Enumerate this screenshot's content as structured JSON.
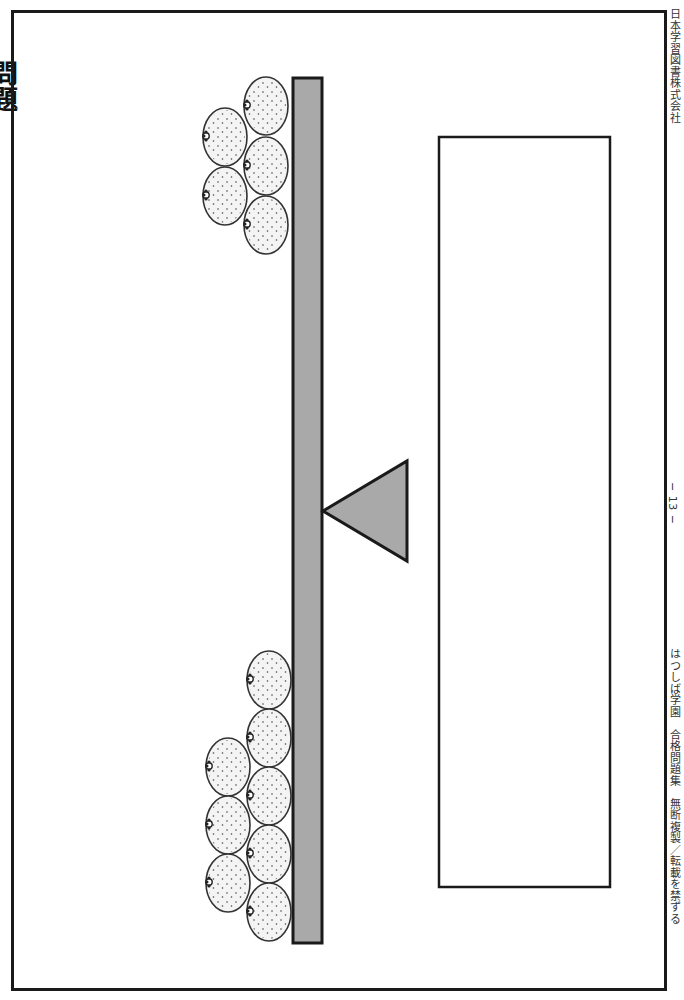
{
  "page": {
    "page_number": "− 13 −",
    "footer_left": "はつしば学園　合格問題集　無断複製／転載を禁ずる",
    "footer_right": "日本学習図書株式会社",
    "heading_partial": "問題"
  },
  "colors": {
    "beam_fill": "#a9a9a9",
    "fulcrum_fill": "#a9a9a9",
    "outline": "#1a1a1a",
    "orange_fill": "#f4f4f4"
  },
  "seesaw": {
    "beam": {
      "x": 293,
      "y": 78,
      "width": 29,
      "height": 865
    },
    "fulcrum": {
      "apex": [
        323,
        511
      ],
      "base_top": [
        407,
        461
      ],
      "base_bottom": [
        407,
        561
      ]
    },
    "top_group": {
      "label": "oranges-top",
      "count": 5,
      "oranges": [
        {
          "cx": 266,
          "cy": 106
        },
        {
          "cx": 266,
          "cy": 166
        },
        {
          "cx": 266,
          "cy": 225
        },
        {
          "cx": 225,
          "cy": 137
        },
        {
          "cx": 225,
          "cy": 196
        }
      ]
    },
    "bottom_group": {
      "label": "oranges-bottom",
      "count": 8,
      "oranges": [
        {
          "cx": 269,
          "cy": 680
        },
        {
          "cx": 269,
          "cy": 738
        },
        {
          "cx": 269,
          "cy": 796
        },
        {
          "cx": 269,
          "cy": 854
        },
        {
          "cx": 269,
          "cy": 912
        },
        {
          "cx": 228,
          "cy": 767
        },
        {
          "cx": 228,
          "cy": 825
        },
        {
          "cx": 228,
          "cy": 883
        }
      ]
    }
  },
  "answer_box": {
    "x": 439,
    "y": 137,
    "width": 171,
    "height": 750,
    "value": ""
  }
}
